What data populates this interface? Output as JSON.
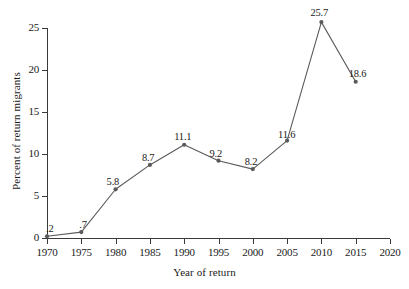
{
  "chart_data": {
    "type": "line",
    "title": "",
    "xlabel": "Year of return",
    "ylabel": "Percent of return migrants",
    "x": [
      1970,
      1975,
      1980,
      1985,
      1990,
      1995,
      2000,
      2005,
      2010,
      2015
    ],
    "values": [
      0.2,
      0.7,
      5.8,
      8.7,
      11.1,
      9.2,
      8.2,
      11.6,
      25.7,
      18.6
    ],
    "point_labels": [
      ".2",
      ".7",
      "5.8",
      "8.7",
      "11.1",
      "9.2",
      "8.2",
      "11.6",
      "25.7",
      "18.6"
    ],
    "xlim": [
      1970,
      2020
    ],
    "ylim": [
      0,
      25
    ],
    "xticks": [
      1970,
      1975,
      1980,
      1985,
      1990,
      1995,
      2000,
      2005,
      2010,
      2015,
      2020
    ],
    "xticklabels": [
      "1970",
      "1975",
      "1980",
      "1985",
      "1990",
      "1995",
      "2000",
      "2005",
      "2010",
      "2015",
      "2020"
    ],
    "yticks": [
      0,
      5,
      10,
      15,
      20,
      25
    ],
    "yticklabels": [
      "0",
      "5",
      "10",
      "15",
      "20",
      "25"
    ],
    "grid": false,
    "legend": null,
    "series_color": "#5a5a5a",
    "axis_color": "#3a3a3a",
    "marker": "circle"
  }
}
